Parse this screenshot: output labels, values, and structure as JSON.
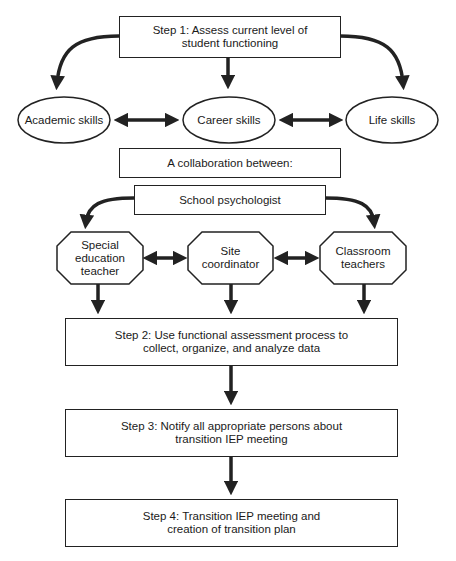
{
  "diagram": {
    "type": "flowchart",
    "colors": {
      "stroke": "#222222",
      "fill": "#ffffff",
      "text": "#1a1a1a"
    },
    "step1": {
      "label": "Step 1: Assess current level of student functioning",
      "line1": "Step 1: Assess current level of",
      "line2": "student functioning"
    },
    "skills": [
      {
        "label": "Academic skills"
      },
      {
        "label": "Career skills"
      },
      {
        "label": "Life skills"
      }
    ],
    "collaboration": {
      "label": "A collaboration between:"
    },
    "school_psychologist": {
      "label": "School psychologist"
    },
    "roles": [
      {
        "line1": "Special",
        "line2": "education",
        "line3": "teacher"
      },
      {
        "line1": "Site",
        "line2": "coordinator"
      },
      {
        "line1": "Classroom",
        "line2": "teachers"
      }
    ],
    "step2": {
      "line1": "Step 2: Use functional assessment process to",
      "line2": "collect, organize, and analyze data"
    },
    "step3": {
      "line1": "Step 3: Notify all appropriate persons about",
      "line2": "transition IEP meeting"
    },
    "step4": {
      "line1": "Step 4: Transition IEP meeting and",
      "line2": "creation of transition plan"
    }
  }
}
